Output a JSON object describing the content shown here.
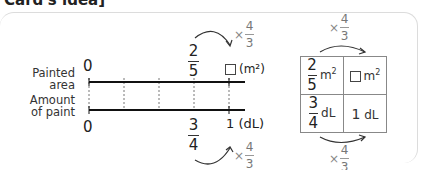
{
  "header": {
    "title": "Card's idea]"
  },
  "number_line": {
    "top_label": "Painted area",
    "bottom_label": "Amount of paint",
    "top_zero": "0",
    "bottom_zero": "0",
    "top_value": {
      "numerator": "2",
      "denominator": "5"
    },
    "top_unknown_unit": "(m²)",
    "bottom_value": {
      "numerator": "3",
      "denominator": "4"
    },
    "bottom_end": "1",
    "bottom_unit": "(dL)",
    "top_multiplier": {
      "symbol": "×",
      "numerator": "4",
      "denominator": "3"
    },
    "bottom_multiplier": {
      "symbol": "×",
      "numerator": "4",
      "denominator": "3"
    },
    "divisions": 4
  },
  "table": {
    "top_multiplier": {
      "symbol": "×",
      "numerator": "4",
      "denominator": "3"
    },
    "bottom_multiplier": {
      "symbol": "×",
      "numerator": "4",
      "denominator": "3"
    },
    "row1": {
      "left": {
        "numerator": "2",
        "denominator": "5",
        "unit": "m",
        "exp": "2"
      },
      "right": {
        "unit": "m",
        "exp": "2"
      }
    },
    "row2": {
      "left": {
        "numerator": "3",
        "denominator": "4",
        "unit": "dL"
      },
      "right": {
        "value": "1",
        "unit": "dL"
      }
    }
  },
  "colors": {
    "line": "#111111",
    "dashed": "#777777",
    "arrow": "#333333",
    "multiplier": "#888888",
    "border": "#dcdcdc"
  }
}
